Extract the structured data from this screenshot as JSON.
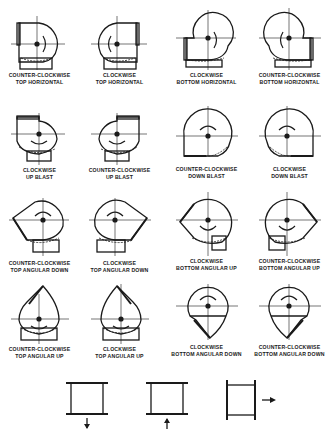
{
  "arrangements": [
    {
      "row": 1,
      "col": 1,
      "rotation": "COUNTER-CLOCKWISE",
      "discharge": "TOP HORIZONTAL"
    },
    {
      "row": 1,
      "col": 2,
      "rotation": "CLOCKWISE",
      "discharge": "TOP HORIZONTAL"
    },
    {
      "row": 1,
      "col": 3,
      "rotation": "CLOCKWISE",
      "discharge": "BOTTOM HORIZONTAL"
    },
    {
      "row": 1,
      "col": 4,
      "rotation": "COUNTER-CLOCKWISE",
      "discharge": "BOTTOM HORIZONTAL"
    },
    {
      "row": 2,
      "col": 1,
      "rotation": "CLOCKWISE",
      "discharge": "UP BLAST"
    },
    {
      "row": 2,
      "col": 2,
      "rotation": "COUNTER-CLOCKWISE",
      "discharge": "UP BLAST"
    },
    {
      "row": 2,
      "col": 3,
      "rotation": "COUNTER-CLOCKWISE",
      "discharge": "DOWN BLAST"
    },
    {
      "row": 2,
      "col": 4,
      "rotation": "CLOCKWISE",
      "discharge": "DOWN BLAST"
    },
    {
      "row": 3,
      "col": 1,
      "rotation": "COUNTER-CLOCKWISE",
      "discharge": "TOP ANGULAR DOWN"
    },
    {
      "row": 3,
      "col": 2,
      "rotation": "CLOCKWISE",
      "discharge": "TOP ANGULAR DOWN"
    },
    {
      "row": 3,
      "col": 3,
      "rotation": "CLOCKWISE",
      "discharge": "BOTTOM ANGULAR UP"
    },
    {
      "row": 3,
      "col": 4,
      "rotation": "COUNTER-CLOCKWISE",
      "discharge": "BOTTOM ANGULAR UP"
    },
    {
      "row": 4,
      "col": 1,
      "rotation": "COUNTER-CLOCKWISE",
      "discharge": "TOP ANGULAR UP"
    },
    {
      "row": 4,
      "col": 2,
      "rotation": "CLOCKWISE",
      "discharge": "TOP ANGULAR UP"
    },
    {
      "row": 4,
      "col": 3,
      "rotation": "CLOCKWISE",
      "discharge": "BOTTOM ANGULAR DOWN"
    },
    {
      "row": 4,
      "col": 4,
      "rotation": "COUNTER-CLOCKWISE",
      "discharge": "BOTTOM ANGULAR DOWN"
    }
  ],
  "bottom_symbols": [
    {
      "name": "flow-down",
      "arrow": "down"
    },
    {
      "name": "flow-up",
      "arrow": "up"
    },
    {
      "name": "flow-right",
      "arrow": "right"
    }
  ]
}
